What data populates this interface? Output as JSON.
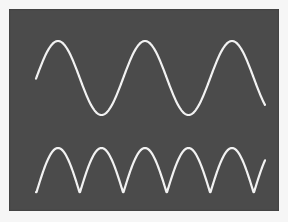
{
  "chart_data": {
    "type": "line",
    "title": "",
    "xlabel": "",
    "ylabel": "",
    "grid": false,
    "legend": "none",
    "colors": {
      "screen_background": "#4b4b4b",
      "page_background": "#f6f6f6",
      "trace": "#f2f2f2"
    },
    "series": [
      {
        "name": "sine-wave",
        "description": "Sinusoidal input waveform (~2.6 cycles shown)",
        "function": "sin",
        "x_start_px": 36,
        "x_end_px": 265,
        "period_px": 87,
        "phase_peak_x_px": 58,
        "center_y_px": 78,
        "amplitude_px": 37,
        "peaks_x_px": [
          58,
          145,
          232
        ],
        "troughs_x_px": [
          102,
          189
        ]
      },
      {
        "name": "full-wave-rectified",
        "description": "Full-wave rectified sine |sin| (same frequency, humps at half-period)",
        "function": "abs_sin",
        "x_start_px": 36,
        "x_end_px": 265,
        "period_px": 87,
        "phase_peak_x_px": 58,
        "baseline_y_px": 193,
        "amplitude_px": 45,
        "peaks_x_px": [
          58,
          102,
          145,
          189,
          232
        ],
        "cusps_x_px": [
          80,
          123,
          167,
          210,
          254
        ]
      }
    ]
  }
}
